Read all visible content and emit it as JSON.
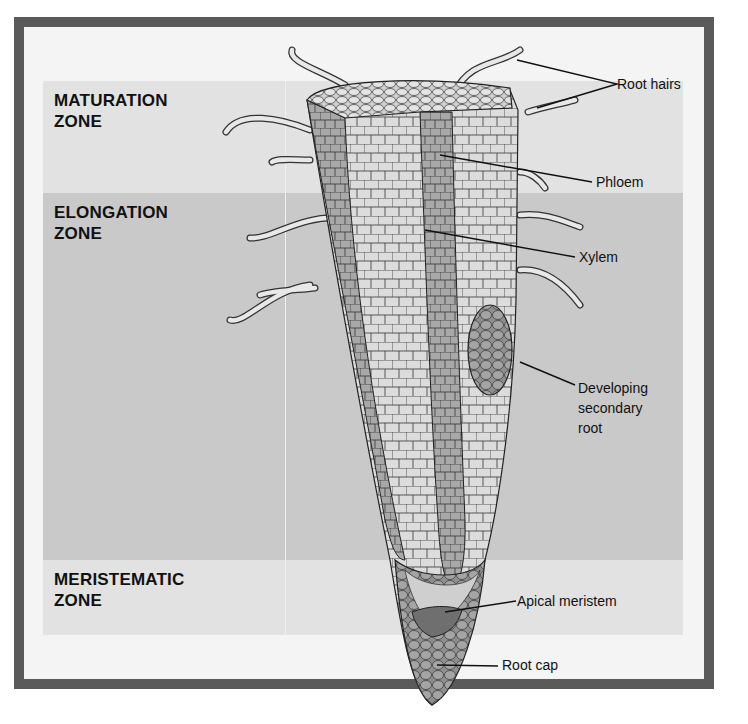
{
  "figure": {
    "zones": [
      {
        "id": "maturation",
        "line1": "MATURATION",
        "line2": "ZONE"
      },
      {
        "id": "elongation",
        "line1": "ELONGATION",
        "line2": "ZONE"
      },
      {
        "id": "meristematic",
        "line1": "MERISTEMATIC",
        "line2": "ZONE"
      }
    ],
    "labels": {
      "root_hairs": "Root hairs",
      "phloem": "Phloem",
      "xylem": "Xylem",
      "secondary_root_1": "Developing",
      "secondary_root_2": "secondary",
      "secondary_root_3": "root",
      "apical_meristem": "Apical meristem",
      "root_cap": "Root cap"
    },
    "colors": {
      "frame": "#5a5a5a",
      "zone_light": "#e2e2e2",
      "zone_dark": "#c9c9c9",
      "cell_fill": "#d8d8d8",
      "tissue_dark": "#8a8a8a"
    }
  }
}
